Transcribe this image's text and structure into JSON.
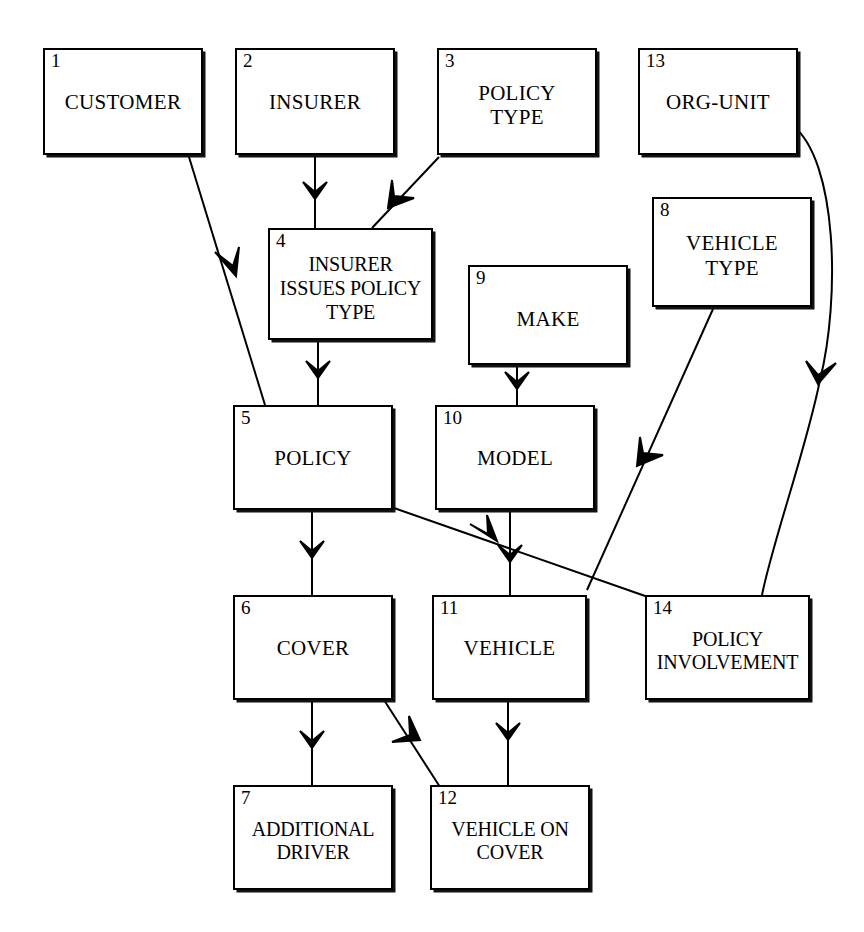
{
  "diagram": {
    "type": "entity-relationship-diagram",
    "title": "",
    "background_color": "#ffffff",
    "line_color": "#000000",
    "width": 864,
    "height": 932,
    "entities": [
      {
        "id": "e1",
        "number": "1",
        "label": "CUSTOMER",
        "x": 43,
        "y": 48,
        "w": 160,
        "h": 107
      },
      {
        "id": "e2",
        "number": "2",
        "label": "INSURER",
        "x": 235,
        "y": 48,
        "w": 160,
        "h": 107
      },
      {
        "id": "e3",
        "number": "3",
        "label": "POLICY\nTYPE",
        "x": 437,
        "y": 48,
        "w": 160,
        "h": 107
      },
      {
        "id": "e13",
        "number": "13",
        "label": "ORG-UNIT",
        "x": 638,
        "y": 48,
        "w": 160,
        "h": 107
      },
      {
        "id": "e4",
        "number": "4",
        "label": "INSURER\nISSUES POLICY\nTYPE",
        "x": 268,
        "y": 228,
        "w": 165,
        "h": 112
      },
      {
        "id": "e8",
        "number": "8",
        "label": "VEHICLE\nTYPE",
        "x": 652,
        "y": 197,
        "w": 160,
        "h": 110
      },
      {
        "id": "e9",
        "number": "9",
        "label": "MAKE",
        "x": 468,
        "y": 265,
        "w": 160,
        "h": 100
      },
      {
        "id": "e5",
        "number": "5",
        "label": "POLICY",
        "x": 233,
        "y": 405,
        "w": 160,
        "h": 105
      },
      {
        "id": "e10",
        "number": "10",
        "label": "MODEL",
        "x": 435,
        "y": 405,
        "w": 160,
        "h": 105
      },
      {
        "id": "e6",
        "number": "6",
        "label": "COVER",
        "x": 233,
        "y": 595,
        "w": 160,
        "h": 105
      },
      {
        "id": "e11",
        "number": "11",
        "label": "VEHICLE",
        "x": 432,
        "y": 595,
        "w": 155,
        "h": 105
      },
      {
        "id": "e14",
        "number": "14",
        "label": "POLICY\nINVOLVEMENT",
        "x": 645,
        "y": 595,
        "w": 165,
        "h": 105
      },
      {
        "id": "e7",
        "number": "7",
        "label": "ADDITIONAL\nDRIVER",
        "x": 233,
        "y": 785,
        "w": 160,
        "h": 105
      },
      {
        "id": "e12",
        "number": "12",
        "label": "VEHICLE ON\nCOVER",
        "x": 430,
        "y": 785,
        "w": 160,
        "h": 105
      }
    ],
    "relationships": [
      {
        "from": "1",
        "to": "5",
        "from_label": "CUSTOMER",
        "to_label": "POLICY",
        "style": "straight"
      },
      {
        "from": "2",
        "to": "4",
        "from_label": "INSURER",
        "to_label": "INSURER ISSUES POLICY TYPE",
        "style": "straight"
      },
      {
        "from": "3",
        "to": "4",
        "from_label": "POLICY TYPE",
        "to_label": "INSURER ISSUES POLICY TYPE",
        "style": "straight"
      },
      {
        "from": "4",
        "to": "5",
        "from_label": "INSURER ISSUES POLICY TYPE",
        "to_label": "POLICY",
        "style": "straight"
      },
      {
        "from": "5",
        "to": "6",
        "from_label": "POLICY",
        "to_label": "COVER",
        "style": "straight"
      },
      {
        "from": "5",
        "to": "14",
        "from_label": "POLICY",
        "to_label": "POLICY INVOLVEMENT",
        "style": "straight"
      },
      {
        "from": "6",
        "to": "7",
        "from_label": "COVER",
        "to_label": "ADDITIONAL DRIVER",
        "style": "straight"
      },
      {
        "from": "6",
        "to": "12",
        "from_label": "COVER",
        "to_label": "VEHICLE ON COVER",
        "style": "straight"
      },
      {
        "from": "8",
        "to": "11",
        "from_label": "VEHICLE TYPE",
        "to_label": "VEHICLE",
        "style": "straight"
      },
      {
        "from": "9",
        "to": "10",
        "from_label": "MAKE",
        "to_label": "MODEL",
        "style": "straight"
      },
      {
        "from": "10",
        "to": "11",
        "from_label": "MODEL",
        "to_label": "VEHICLE",
        "style": "straight"
      },
      {
        "from": "11",
        "to": "12",
        "from_label": "VEHICLE",
        "to_label": "VEHICLE ON COVER",
        "style": "straight"
      },
      {
        "from": "13",
        "to": "14",
        "from_label": "ORG-UNIT",
        "to_label": "POLICY INVOLVEMENT",
        "style": "curved"
      }
    ]
  }
}
